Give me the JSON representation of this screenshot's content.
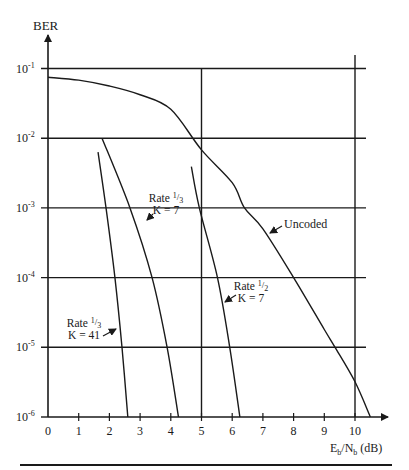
{
  "chart_data": {
    "type": "line",
    "title": "",
    "xlabel": {
      "main": "E",
      "sub1": "b",
      "mid": "/N",
      "sub2": "b",
      "unit": " (dB)"
    },
    "ylabel": "BER",
    "xlim": [
      0,
      11.2
    ],
    "ylim_log10": [
      -6,
      -1
    ],
    "y_scale": "log",
    "grid": "on (horizontal at each decade, vertical at 5 and 10 dB)",
    "x_ticks": [
      0,
      1,
      2,
      3,
      4,
      5,
      6,
      7,
      8,
      9,
      10
    ],
    "x_tick_labels": [
      "0",
      "1",
      "2",
      "3",
      "4",
      "5",
      "6",
      "7",
      "8",
      "9",
      "10"
    ],
    "y_ticks_exp": [
      -1,
      -2,
      -3,
      -4,
      -5,
      -6
    ],
    "y_tick_labels": [
      {
        "base": "10",
        "exp": "-1"
      },
      {
        "base": "10",
        "exp": "-2"
      },
      {
        "base": "10",
        "exp": "-3"
      },
      {
        "base": "10",
        "exp": "-4"
      },
      {
        "base": "10",
        "exp": "-5"
      },
      {
        "base": "10",
        "exp": "-6"
      }
    ],
    "vertical_gridlines": [
      5,
      10
    ],
    "series": [
      {
        "name": "Uncoded",
        "x": [
          0,
          1,
          2,
          3,
          4,
          5,
          6,
          6.4,
          7,
          8,
          9,
          9.35,
          10,
          10.5
        ],
        "y": [
          0.075,
          0.068,
          0.056,
          0.042,
          0.026,
          0.0068,
          0.0023,
          0.001,
          0.0005,
          0.0001,
          1.8e-05,
          1e-05,
          3.2e-06,
          1e-06
        ],
        "label": {
          "lines": [
            "Uncoded"
          ],
          "anchor_x": 8.1,
          "anchor_y": 0.0005
        }
      },
      {
        "name": "Rate 1/3 K = 7",
        "x": [
          1.76,
          2.67,
          3.39,
          3.88,
          4.25
        ],
        "y": [
          0.01,
          0.001,
          0.0001,
          1e-05,
          1e-06
        ],
        "label": {
          "rate": "Rate ",
          "num": "1",
          "den": "3",
          "k": "K = 7"
        }
      },
      {
        "name": "Rate 1/3 K = 41",
        "x": [
          1.63,
          1.89,
          2.18,
          2.41,
          2.6
        ],
        "y": [
          0.0063,
          0.001,
          0.0001,
          1e-05,
          1e-06
        ],
        "label": {
          "rate": "Rate ",
          "num": "1",
          "den": "3",
          "k": "K = 41"
        }
      },
      {
        "name": "Rate 1/2 K = 7",
        "x": [
          4.67,
          4.93,
          5.52,
          5.92,
          6.25
        ],
        "y": [
          0.0039,
          0.001,
          0.0001,
          1e-05,
          1e-06
        ],
        "label": {
          "rate": "Rate ",
          "num": "1",
          "den": "2",
          "k": "K = 7"
        }
      }
    ],
    "legend": "none (inline annotations with arrows)"
  }
}
